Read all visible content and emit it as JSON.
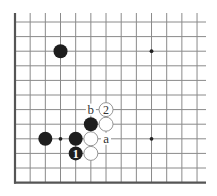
{
  "diagram": {
    "type": "go-board-partial",
    "colors": {
      "black_stone": "#1e1e1e",
      "white_stone": "#ffffff",
      "grid": "#8a8a8a",
      "edge": "#555555"
    },
    "grid": {
      "columns": 13,
      "rows": 12,
      "edges": [
        "left",
        "bottom"
      ]
    },
    "star_points": [
      {
        "col": 9,
        "row": 2
      },
      {
        "col": 3,
        "row": 8
      },
      {
        "col": 9,
        "row": 8
      }
    ],
    "stones": [
      {
        "color": "black",
        "col": 3,
        "row": 2,
        "label": ""
      },
      {
        "color": "black",
        "col": 2,
        "row": 8,
        "label": ""
      },
      {
        "color": "black",
        "col": 4,
        "row": 8,
        "label": ""
      },
      {
        "color": "white",
        "col": 5,
        "row": 8,
        "label": ""
      },
      {
        "color": "black",
        "col": 5,
        "row": 7,
        "label": ""
      },
      {
        "color": "white",
        "col": 6,
        "row": 7,
        "label": ""
      },
      {
        "color": "white",
        "col": 6,
        "row": 6,
        "label": "2"
      },
      {
        "color": "black",
        "col": 4,
        "row": 9,
        "label": "1"
      },
      {
        "color": "white",
        "col": 5,
        "row": 9,
        "label": ""
      }
    ],
    "point_labels": [
      {
        "text": "a",
        "col": 6,
        "row": 8
      },
      {
        "text": "b",
        "col": 5,
        "row": 6
      }
    ]
  }
}
